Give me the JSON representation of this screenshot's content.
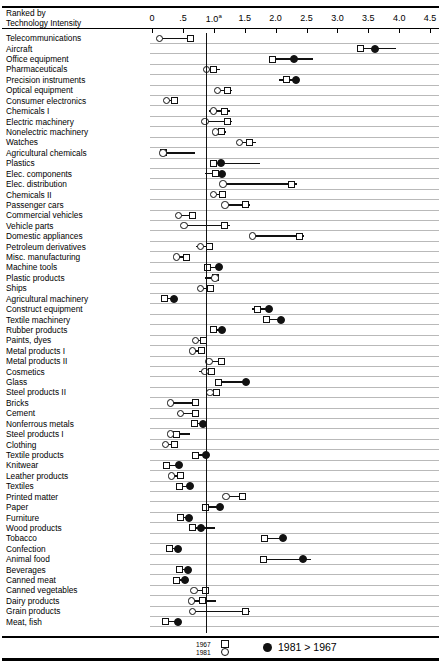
{
  "header": {
    "ranked_label_line1": "Ranked by",
    "ranked_label_line2": "Technology Intensity"
  },
  "legend": {
    "year_old": "1967",
    "year_new": "1981",
    "comparison": "1981  >  1967"
  },
  "chart_data": {
    "type": "scatter",
    "title": "",
    "subtitle": "",
    "xlabel": "",
    "ylabel": "Ranked by Technology Intensity",
    "xlim": [
      0,
      4.5
    ],
    "xticks": [
      0,
      0.5,
      1.0,
      1.5,
      2.0,
      2.5,
      3.0,
      3.5,
      4.0,
      4.5
    ],
    "xticklabels": [
      "0",
      ".5",
      "1.0a",
      "1.5",
      "2.0",
      "2.5",
      "3.0",
      "3.5",
      "4.0",
      "4.5"
    ],
    "unity_reference": 1.0,
    "grid": true,
    "legend_position": "bottom",
    "series": [
      {
        "name": "1967",
        "marker": "open-square"
      },
      {
        "name": "1981",
        "marker": "open-circle"
      },
      {
        "name": "1981 > 1967",
        "marker": "filled-circle"
      }
    ],
    "categories": [
      "Telecommunications",
      "Aircraft",
      "Office equipment",
      "Pharmaceuticals",
      "Precision instruments",
      "Optical equipment",
      "Consumer electronics",
      "Chemicals I",
      "Electric machinery",
      "Nonelectric machinery",
      "Watches",
      "Agricultural chemicals",
      "Plastics",
      "Elec. components",
      "Elec. distribution",
      "Chemicals II",
      "Passenger cars",
      "Commercial vehicles",
      "Vehicle parts",
      "Domestic appliances",
      "Petroleum derivatives",
      "Misc. manufacturing",
      "Machine tools",
      "Plastic products",
      "Ships",
      "Agricultural machinery",
      "Construct equipment",
      "Textile machinery",
      "Rubber products",
      "Paints, dyes",
      "Metal products I",
      "Metal products II",
      "Cosmetics",
      "Glass",
      "Steel products II",
      "Bricks",
      "Cement",
      "Nonferrous metals",
      "Steel products I",
      "Clothing",
      "Textile products",
      "Knitwear",
      "Leather products",
      "Textiles",
      "Printed matter",
      "Paper",
      "Furniture",
      "Wood products",
      "Tobacco",
      "Confection",
      "Animal food",
      "Beverages",
      "Canned meat",
      "Canned vegetables",
      "Dairy products",
      "Grain products",
      "Meat, fish"
    ],
    "points": [
      {
        "category": "Telecommunications",
        "v1981": 0.12,
        "v1967": 0.62,
        "filled": false,
        "line": [
          0.12,
          0.62
        ]
      },
      {
        "category": "Aircraft",
        "v1981": 3.61,
        "v1967": 3.37,
        "filled": true,
        "line": [
          3.37,
          3.95
        ]
      },
      {
        "category": "Office equipment",
        "v1981": 2.3,
        "v1967": 1.95,
        "filled": true,
        "line": [
          1.95,
          2.6
        ]
      },
      {
        "category": "Pharmaceuticals",
        "v1981": 0.88,
        "v1967": 1.0,
        "filled": false,
        "line": [
          0.85,
          1.1
        ]
      },
      {
        "category": "Precision instruments",
        "v1981": 2.33,
        "v1967": 2.18,
        "filled": true,
        "line": [
          2.05,
          2.36
        ]
      },
      {
        "category": "Optical equipment",
        "v1981": 1.06,
        "v1967": 1.22,
        "filled": false,
        "line": [
          1.06,
          1.3
        ]
      },
      {
        "category": "Consumer electronics",
        "v1981": 0.23,
        "v1967": 0.36,
        "filled": false,
        "line": [
          0.23,
          0.4
        ]
      },
      {
        "category": "Chemicals I",
        "v1981": 1.0,
        "v1967": 1.18,
        "filled": false,
        "line": [
          0.92,
          1.26
        ]
      },
      {
        "category": "Electric machinery",
        "v1981": 0.86,
        "v1967": 1.22,
        "filled": false,
        "line": [
          0.86,
          1.3
        ]
      },
      {
        "category": "Nonelectric machinery",
        "v1981": 1.03,
        "v1967": 1.13,
        "filled": false,
        "line": [
          1.0,
          1.2
        ]
      },
      {
        "category": "Watches",
        "v1981": 1.42,
        "v1967": 1.58,
        "filled": false,
        "line": [
          1.38,
          1.68
        ]
      },
      {
        "category": "Agricultural chemicals",
        "v1981": 0.18,
        "v1967": 0.18,
        "filled": false,
        "line": [
          0.18,
          0.7
        ]
      },
      {
        "category": "Plastics",
        "v1981": 1.12,
        "v1967": 1.0,
        "filled": true,
        "line": [
          1.0,
          1.75
        ]
      },
      {
        "category": "Elec. components",
        "v1981": 1.14,
        "v1967": 1.03,
        "filled": true,
        "line": [
          0.86,
          1.14
        ]
      },
      {
        "category": "Elec. distribution",
        "v1981": 1.15,
        "v1967": 2.26,
        "filled": false,
        "line": [
          1.15,
          2.34
        ]
      },
      {
        "category": "Chemicals II",
        "v1981": 1.0,
        "v1967": 1.14,
        "filled": false,
        "line": [
          0.96,
          1.2
        ]
      },
      {
        "category": "Passenger cars",
        "v1981": 1.18,
        "v1967": 1.52,
        "filled": false,
        "line": [
          1.18,
          1.58
        ]
      },
      {
        "category": "Commercial vehicles",
        "v1981": 0.43,
        "v1967": 0.66,
        "filled": false,
        "line": [
          0.43,
          0.7
        ]
      },
      {
        "category": "Vehicle parts",
        "v1981": 0.52,
        "v1967": 1.18,
        "filled": false,
        "line": [
          0.52,
          1.26
        ]
      },
      {
        "category": "Domestic appliances",
        "v1981": 1.63,
        "v1967": 2.38,
        "filled": false,
        "line": [
          1.63,
          2.46
        ]
      },
      {
        "category": "Petroleum derivatives",
        "v1981": 0.78,
        "v1967": 0.93,
        "filled": false,
        "line": [
          0.72,
          0.98
        ]
      },
      {
        "category": "Misc. manufacturing",
        "v1981": 0.4,
        "v1967": 0.56,
        "filled": false,
        "line": [
          0.36,
          0.6
        ]
      },
      {
        "category": "Machine tools",
        "v1981": 1.08,
        "v1967": 0.9,
        "filled": true,
        "line": [
          0.9,
          1.12
        ]
      },
      {
        "category": "Plastic products",
        "v1981": 1.02,
        "v1967": 1.02,
        "filled": false,
        "line": [
          0.85,
          1.02
        ]
      },
      {
        "category": "Ships",
        "v1981": 0.78,
        "v1967": 0.94,
        "filled": false,
        "line": [
          0.74,
          0.98
        ]
      },
      {
        "category": "Agricultural machinery",
        "v1981": 0.36,
        "v1967": 0.2,
        "filled": true,
        "line": [
          0.18,
          0.4
        ]
      },
      {
        "category": "Construct equipment",
        "v1981": 1.9,
        "v1967": 1.7,
        "filled": true,
        "line": [
          1.62,
          1.94
        ]
      },
      {
        "category": "Textile machinery",
        "v1981": 2.08,
        "v1967": 1.86,
        "filled": true,
        "line": [
          1.86,
          2.12
        ]
      },
      {
        "category": "Rubber products",
        "v1981": 1.14,
        "v1967": 1.0,
        "filled": true,
        "line": [
          1.0,
          1.18
        ]
      },
      {
        "category": "Paints, dyes",
        "v1981": 0.7,
        "v1967": 0.84,
        "filled": false,
        "line": [
          0.66,
          0.88
        ]
      },
      {
        "category": "Metal products I",
        "v1981": 0.66,
        "v1967": 0.8,
        "filled": false,
        "line": [
          0.62,
          0.84
        ]
      },
      {
        "category": "Metal products II",
        "v1981": 0.92,
        "v1967": 1.12,
        "filled": false,
        "line": [
          0.92,
          1.16
        ]
      },
      {
        "category": "Cosmetics",
        "v1981": 0.86,
        "v1967": 0.96,
        "filled": false,
        "line": [
          0.76,
          1.0
        ]
      },
      {
        "category": "Glass",
        "v1981": 1.52,
        "v1967": 1.08,
        "filled": true,
        "line": [
          1.04,
          1.56
        ]
      },
      {
        "category": "Steel products II",
        "v1981": 0.94,
        "v1967": 1.04,
        "filled": false,
        "line": [
          0.92,
          1.06
        ]
      },
      {
        "category": "Bricks",
        "v1981": 0.3,
        "v1967": 0.7,
        "filled": false,
        "line": [
          0.28,
          0.74
        ]
      },
      {
        "category": "Cement",
        "v1981": 0.46,
        "v1967": 0.7,
        "filled": false,
        "line": [
          0.4,
          0.74
        ]
      },
      {
        "category": "Nonferrous metals",
        "v1981": 0.82,
        "v1967": 0.68,
        "filled": true,
        "line": [
          0.64,
          0.84
        ]
      },
      {
        "category": "Steel products I",
        "v1981": 0.3,
        "v1967": 0.4,
        "filled": false,
        "line": [
          0.28,
          0.62
        ]
      },
      {
        "category": "Clothing",
        "v1981": 0.22,
        "v1967": 0.36,
        "filled": false,
        "line": [
          0.2,
          0.4
        ]
      },
      {
        "category": "Textile products",
        "v1981": 0.88,
        "v1967": 0.7,
        "filled": true,
        "line": [
          0.68,
          0.92
        ]
      },
      {
        "category": "Knitwear",
        "v1981": 0.44,
        "v1967": 0.24,
        "filled": true,
        "line": [
          0.2,
          0.48
        ]
      },
      {
        "category": "Leather products",
        "v1981": 0.32,
        "v1967": 0.46,
        "filled": false,
        "line": [
          0.3,
          0.5
        ]
      },
      {
        "category": "Textiles",
        "v1981": 0.62,
        "v1967": 0.44,
        "filled": true,
        "line": [
          0.42,
          0.66
        ]
      },
      {
        "category": "Printed matter",
        "v1981": 1.2,
        "v1967": 1.46,
        "filled": false,
        "line": [
          1.2,
          1.52
        ]
      },
      {
        "category": "Paper",
        "v1981": 1.1,
        "v1967": 0.86,
        "filled": true,
        "line": [
          0.86,
          1.12
        ]
      },
      {
        "category": "Furniture",
        "v1981": 0.6,
        "v1967": 0.46,
        "filled": true,
        "line": [
          0.42,
          0.62
        ]
      },
      {
        "category": "Wood products",
        "v1981": 0.8,
        "v1967": 0.66,
        "filled": true,
        "line": [
          0.66,
          1.02
        ]
      },
      {
        "category": "Tobacco",
        "v1981": 2.12,
        "v1967": 1.82,
        "filled": true,
        "line": [
          1.82,
          2.16
        ]
      },
      {
        "category": "Confection",
        "v1981": 0.42,
        "v1967": 0.28,
        "filled": true,
        "line": [
          0.22,
          0.46
        ]
      },
      {
        "category": "Animal food",
        "v1981": 2.44,
        "v1967": 1.8,
        "filled": true,
        "line": [
          1.8,
          2.58
        ]
      },
      {
        "category": "Beverages",
        "v1981": 0.58,
        "v1967": 0.44,
        "filled": true,
        "line": [
          0.44,
          0.6
        ]
      },
      {
        "category": "Canned meat",
        "v1981": 0.54,
        "v1967": 0.4,
        "filled": true,
        "line": [
          0.38,
          0.58
        ]
      },
      {
        "category": "Canned vegetables",
        "v1981": 0.68,
        "v1967": 0.86,
        "filled": false,
        "line": [
          0.64,
          0.9
        ]
      },
      {
        "category": "Dairy products",
        "v1981": 0.64,
        "v1967": 0.82,
        "filled": false,
        "line": [
          0.62,
          1.04
        ]
      },
      {
        "category": "Grain products",
        "v1981": 0.66,
        "v1967": 1.52,
        "filled": false,
        "line": [
          0.66,
          1.58
        ]
      },
      {
        "category": "Meat, fish",
        "v1981": 0.42,
        "v1967": 0.22,
        "filled": true,
        "line": [
          0.22,
          0.46
        ]
      }
    ]
  }
}
